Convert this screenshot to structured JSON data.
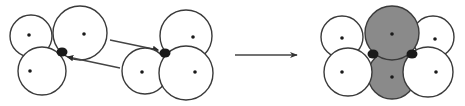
{
  "diagram": {
    "colors": {
      "background": "#ffffff",
      "circle_fill": "#ffffff",
      "circle_stroke": "#3a3a3a",
      "shaded_fill": "#8a8a8a",
      "dot": "#1a1a1a",
      "arrow": "#444444"
    },
    "left_group": {
      "circles": [
        {
          "cx": 31,
          "cy": 36,
          "r": 21,
          "dot": [
            29,
            35
          ]
        },
        {
          "cx": 80,
          "cy": 33,
          "r": 27,
          "dot": [
            84,
            34
          ]
        },
        {
          "cx": 42,
          "cy": 71,
          "r": 24,
          "dot": [
            30,
            71
          ]
        }
      ],
      "junction": {
        "cx": 62,
        "cy": 52,
        "r": 5
      }
    },
    "right_group": {
      "circles": [
        {
          "cx": 186,
          "cy": 36,
          "r": 26,
          "dot": [
            193,
            37
          ]
        },
        {
          "cx": 145,
          "cy": 71,
          "r": 23,
          "dot": [
            142,
            72
          ]
        },
        {
          "cx": 186,
          "cy": 73,
          "r": 27,
          "dot": [
            195,
            72
          ]
        }
      ],
      "junction": {
        "cx": 165,
        "cy": 53,
        "r": 5
      }
    },
    "connectors": [
      {
        "from": [
          110,
          40
        ],
        "to": [
          158,
          50
        ],
        "direction": "right"
      },
      {
        "from": [
          120,
          68
        ],
        "to": [
          68,
          57
        ],
        "direction": "left"
      }
    ],
    "transition_arrow": {
      "from": [
        235,
        55
      ],
      "to": [
        297,
        55
      ]
    },
    "result": {
      "white_circles": [
        {
          "cx": 342,
          "cy": 37,
          "r": 21,
          "dot": [
            342,
            38
          ]
        },
        {
          "cx": 348,
          "cy": 72,
          "r": 24,
          "dot": [
            342,
            72
          ]
        },
        {
          "cx": 433,
          "cy": 37,
          "r": 21,
          "dot": [
            435,
            39
          ]
        },
        {
          "cx": 428,
          "cy": 72,
          "r": 25,
          "dot": [
            436,
            72
          ]
        }
      ],
      "shaded_circles": [
        {
          "cx": 392,
          "cy": 33,
          "r": 27,
          "dot": [
            392,
            34
          ]
        },
        {
          "cx": 392,
          "cy": 75,
          "r": 24,
          "dot": [
            392,
            77
          ]
        }
      ],
      "junctions": [
        {
          "cx": 373,
          "cy": 54,
          "r": 5
        },
        {
          "cx": 412,
          "cy": 54,
          "r": 5
        }
      ]
    }
  }
}
